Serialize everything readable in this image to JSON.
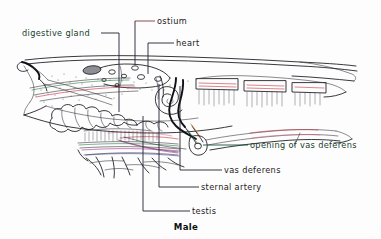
{
  "figure": {
    "title": "Male",
    "background_color": "#fdfdfd",
    "ink_color": "#15151c",
    "accent_colors": {
      "red": "#c8323c",
      "green": "#2f7a46",
      "magenta": "#a53090",
      "blue": "#3a4fa8",
      "orange": "#d2761e",
      "maroon_leader": "#7d3a3a",
      "green_leader": "#14503c"
    }
  },
  "labels": [
    {
      "id": "digestive-gland",
      "text": "digestive gland",
      "text_color": "#17402c",
      "leader_color": "#20202c",
      "anchor": "right",
      "text_x": 22,
      "text_y": 33,
      "leader": "M 101,33 L 119,33 L 119,112"
    },
    {
      "id": "ostium",
      "text": "ostium",
      "text_color": "#1b1b1b",
      "leader_color": "#7d3a3a",
      "anchor": "left",
      "text_x": 157,
      "text_y": 21,
      "leader": "M 135,21 L 155,21"
    },
    {
      "id": "ostium-drop",
      "text": "",
      "leader_color": "#20202c",
      "leader": "M 135,21 L 135,65"
    },
    {
      "id": "heart",
      "text": "heart",
      "text_color": "#1b1b1b",
      "leader_color": "#20202c",
      "anchor": "left",
      "text_x": 176,
      "text_y": 43,
      "leader": "M 148,43 L 174,43 M 148,43 L 148,74"
    },
    {
      "id": "opening-of-vas-deferens",
      "text": "opening of vas deferens",
      "text_color": "#17402c",
      "leader_color": "#14503c",
      "anchor": "left",
      "text_x": 250,
      "text_y": 145,
      "leader": "M 203,145 L 248,145"
    },
    {
      "id": "vas-deferens",
      "text": "vas deferens",
      "text_color": "#1b1b1b",
      "leader_color": "#20202c",
      "anchor": "left",
      "text_x": 224,
      "text_y": 170,
      "leader": "M 180,170 L 222,170 M 180,170 L 180,86"
    },
    {
      "id": "sternal-artery",
      "text": "sternal artery",
      "text_color": "#1b1b1b",
      "leader_color": "#20202c",
      "anchor": "left",
      "text_x": 201,
      "text_y": 187,
      "leader": "M 159,187 L 199,187 M 159,187 L 159,84"
    },
    {
      "id": "testis",
      "text": "testis",
      "text_color": "#1b1b1b",
      "leader_color": "#20202c",
      "anchor": "left",
      "text_x": 192,
      "text_y": 211,
      "leader": "M 143,211 L 190,211 M 143,211 L 143,116"
    }
  ],
  "caption": {
    "text": "Male",
    "x": 186,
    "y": 230
  }
}
